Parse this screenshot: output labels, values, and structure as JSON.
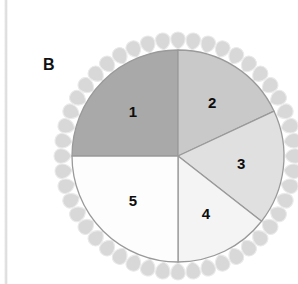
{
  "panel": {
    "label": "B",
    "background_color": "#ffffff"
  },
  "left_rule": {
    "name": "vertical-divider-line",
    "color": "#dcdcdc"
  },
  "pie": {
    "center_x": 178,
    "center_y": 156,
    "radius": 106,
    "outline_color": "#9a9a9a",
    "petal_color": "#d8d8d8",
    "petal_count": 48
  },
  "chart_data": {
    "type": "pie",
    "title": "B",
    "xlabel": "",
    "ylabel": "",
    "legend_position": "none",
    "grid": false,
    "categories": [
      "1",
      "2",
      "3",
      "4",
      "5"
    ],
    "labels": [
      "1",
      "2",
      "3",
      "4",
      "5"
    ],
    "values": [
      25.0,
      18.0,
      17.5,
      14.5,
      25.0
    ],
    "start_angles_deg": [
      270,
      0,
      65,
      128,
      180
    ],
    "end_angles_deg": [
      360,
      65,
      128,
      180,
      270
    ],
    "angles_deg": [
      90,
      65,
      63,
      52,
      90
    ],
    "colors": [
      "#a9a9a9",
      "#c9c9c9",
      "#e0e0e0",
      "#f4f4f4",
      "#fdfdfd"
    ],
    "slices": [
      {
        "label": "1",
        "value": 25.0,
        "angle_deg": 90,
        "color": "#a9a9a9"
      },
      {
        "label": "2",
        "value": 18.0,
        "angle_deg": 65,
        "color": "#c9c9c9"
      },
      {
        "label": "3",
        "value": 17.5,
        "angle_deg": 63,
        "color": "#e0e0e0"
      },
      {
        "label": "4",
        "value": 14.5,
        "angle_deg": 52,
        "color": "#f4f4f4"
      },
      {
        "label": "5",
        "value": 25.0,
        "angle_deg": 90,
        "color": "#fdfdfd"
      }
    ]
  }
}
